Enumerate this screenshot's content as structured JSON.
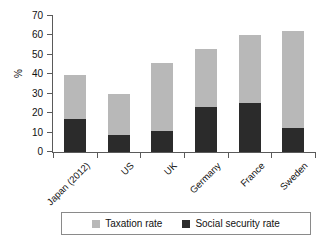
{
  "chart_data": {
    "type": "bar",
    "subtype": "stacked-vertical",
    "title": "",
    "xlabel": "",
    "ylabel": "%",
    "ylim": [
      0,
      70
    ],
    "ytick_values": [
      0,
      10,
      20,
      30,
      40,
      50,
      60,
      70
    ],
    "ytick_labels": [
      "0",
      "10",
      "20",
      "30",
      "40",
      "50",
      "60",
      "70"
    ],
    "grid": false,
    "legend_position": "bottom",
    "categories": [
      "Japan (2012)",
      "US",
      "UK",
      "Germany",
      "France",
      "Sweden"
    ],
    "series": [
      {
        "name": "Social security rate",
        "color": "#2b2b2b",
        "values": [
          17.0,
          8.8,
          11.0,
          23.0,
          25.2,
          12.6
        ]
      },
      {
        "name": "Taxation rate",
        "color": "#b8b8b8",
        "values": [
          22.6,
          21.3,
          34.6,
          30.2,
          34.8,
          49.9
        ]
      }
    ],
    "totals": [
      39.6,
      30.1,
      45.6,
      53.2,
      60.0,
      62.5
    ]
  },
  "legend": {
    "entries": [
      {
        "label": "Taxation rate",
        "color": "#b8b8b8"
      },
      {
        "label": "Social security rate",
        "color": "#2b2b2b"
      }
    ]
  },
  "axis": {
    "y_title": "%"
  }
}
